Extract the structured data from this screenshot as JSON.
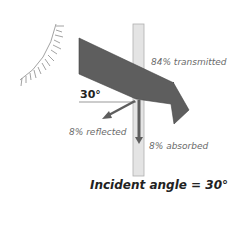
{
  "diagram": {
    "incident_angle_label": "30°",
    "labels": {
      "transmitted": "84% transmitted",
      "reflected": "8% reflected",
      "absorbed": "8% absorbed"
    },
    "caption": "Incident angle = 30°",
    "colors": {
      "beam": "#5e5e5e",
      "pane": "#e4e4e4",
      "pane_edge": "#b0b0b0",
      "sun": "#8a8a8a"
    }
  }
}
